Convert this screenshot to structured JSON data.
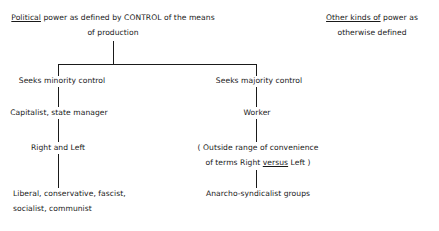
{
  "root": {
    "title_underlined": "Political",
    "title_rest": " power as defined by CONTROL of the means",
    "title_line2": "of production"
  },
  "other": {
    "underlined": "Other kinds of",
    "rest": " power as",
    "line2": "otherwise defined"
  },
  "left_branch": {
    "nodes": [
      "Seeks minority control",
      "Capitalist, state manager",
      "Right and Left",
      "Liberal, conservative, fascist,",
      "socialist, communist"
    ]
  },
  "right_branch": {
    "nodes": [
      "Seeks majority control",
      "Worker",
      "( Outside range of convenience",
      "of terms Right ",
      "versus",
      " Left )",
      "Anarcho-syndicalist groups"
    ]
  }
}
